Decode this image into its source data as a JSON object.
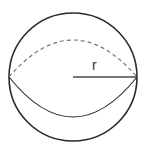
{
  "diagram": {
    "title": "",
    "shape": "sphere",
    "labels": {
      "radius": "r"
    },
    "colors": {
      "stroke": "#2a2a2a",
      "dashed": "#7a7a7a",
      "radius_line": "#4a4a4a",
      "background": "#ffffff"
    }
  }
}
